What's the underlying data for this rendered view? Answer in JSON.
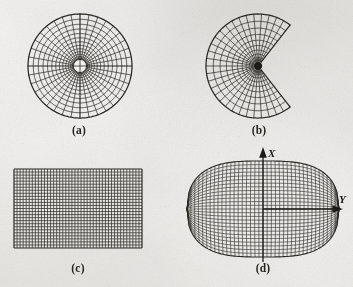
{
  "figure": {
    "page_background": "#e9e7e3",
    "ink_color": "#2a2823",
    "panels": [
      {
        "id": "panel-a",
        "caption": "(a)",
        "mesh_type": "polar-full-annulus",
        "description": "Full circular O-type polar mesh with small circular hole at the centre",
        "center": [
          79,
          66
        ],
        "outer_radius": 52,
        "inner_radius": 7,
        "radial_divisions": 36,
        "ring_divisions": 13
      },
      {
        "id": "panel-b",
        "caption": "(b)",
        "mesh_type": "polar-c-sector",
        "description": "C-type polar mesh, wedge sector removed on the right side, solid hub at centre",
        "center": [
          258,
          66
        ],
        "outer_radius": 52,
        "inner_radius": 5,
        "start_angle_deg": 52,
        "end_angle_deg": 308,
        "radial_divisions": 30,
        "ring_divisions": 10
      },
      {
        "id": "panel-c",
        "caption": "(c)",
        "mesh_type": "cartesian-rectangular",
        "description": "Uniform rectangular Cartesian grid",
        "rect": [
          14,
          169,
          128,
          79
        ],
        "columns": 42,
        "rows": 26
      },
      {
        "id": "panel-d",
        "caption": "(d)",
        "mesh_type": "body-fitted-barrel",
        "description": "Body-fitted curvilinear barrel/lens shaped mesh with X and Y axes",
        "center": [
          263,
          209
        ],
        "half_width": 76,
        "half_height": 48,
        "columns": 38,
        "rows": 26,
        "axes": {
          "x_label": "X",
          "y_label": "Y",
          "x_axis_from": [
            263,
            262
          ],
          "x_axis_to": [
            263,
            152
          ],
          "y_axis_from": [
            263,
            209
          ],
          "y_axis_to": [
            338,
            209
          ]
        }
      }
    ],
    "captions": {
      "a": "(a)",
      "b": "(b)",
      "c": "(c)",
      "d": "(d)"
    },
    "axis_labels": {
      "x": "X",
      "y": "Y"
    }
  }
}
